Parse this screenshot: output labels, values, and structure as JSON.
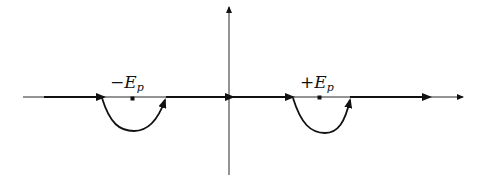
{
  "diagram": {
    "type": "complex-plane integration contour",
    "labels": {
      "left_pole": {
        "sign": "−",
        "symbol": "E",
        "subscript": "p"
      },
      "right_pole": {
        "sign": "+",
        "symbol": "E",
        "subscript": "p"
      }
    },
    "poles": [
      {
        "name": "-E_p",
        "x": 133,
        "y": 97
      },
      {
        "name": "+E_p",
        "x": 320,
        "y": 97
      }
    ],
    "contour": "real axis with semicircular detours below each pole",
    "colors": {
      "line": "#111111",
      "background": "#ffffff"
    }
  }
}
